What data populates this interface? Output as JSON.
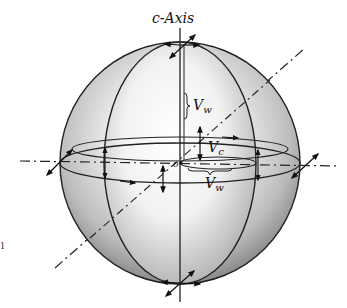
{
  "figure": {
    "axis_label": "c-Axis",
    "labels": {
      "vw_upper": "V",
      "vw_upper_sub": "w",
      "vc": "V",
      "vc_sub": "c",
      "vw_lower": "V",
      "vw_lower_sub": "w",
      "origin": "o"
    },
    "margin_mark": "l"
  }
}
